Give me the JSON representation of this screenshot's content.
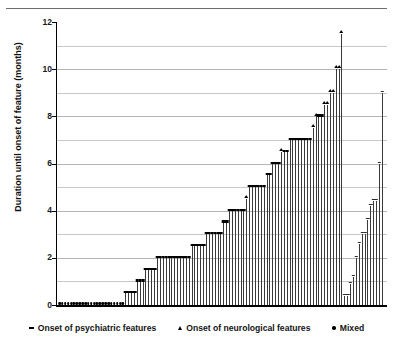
{
  "chart_data": {
    "type": "bar",
    "title": "",
    "xlabel": "",
    "ylabel": "Duration until onset of feature (months)",
    "ylim": [
      0,
      12
    ],
    "ytick_values": [
      0,
      2,
      4,
      6,
      8,
      10,
      12
    ],
    "ytick_labels": [
      "0",
      "2",
      "4",
      "6",
      "8",
      "10",
      "12"
    ],
    "gridlines": [
      1,
      2,
      3,
      4,
      5,
      6,
      7,
      8,
      9,
      10,
      11
    ],
    "grid": true,
    "legend_position": "below-axis",
    "x_axis_visible_ticks": false,
    "marker_categories": [
      {
        "key": "psychiatric",
        "marker": "dash",
        "label": "Onset of psychiatric features"
      },
      {
        "key": "neurological",
        "marker": "triangle",
        "label": "Onset of neurological features"
      },
      {
        "key": "mixed",
        "marker": "dot",
        "label": "Mixed"
      }
    ],
    "values": [
      0,
      0,
      0,
      0,
      0,
      0,
      0,
      0,
      0,
      0,
      0,
      0,
      0,
      0,
      0,
      0,
      0,
      0,
      0,
      0,
      0,
      0,
      0,
      0.5,
      0.5,
      0.5,
      0.5,
      1.0,
      1.0,
      1.0,
      1.5,
      1.5,
      1.5,
      1.5,
      2.0,
      2.0,
      2.0,
      2.0,
      2.0,
      2.0,
      2.0,
      2.0,
      2.0,
      2.0,
      2.0,
      2.0,
      2.5,
      2.5,
      2.5,
      2.5,
      2.5,
      3.0,
      3.0,
      3.0,
      3.0,
      3.0,
      3.0,
      3.5,
      3.5,
      4.0,
      4.0,
      4.0,
      4.0,
      4.0,
      4.0,
      4.5,
      5.0,
      5.0,
      5.0,
      5.0,
      5.0,
      5.0,
      5.5,
      5.5,
      6.0,
      6.0,
      6.0,
      6.5,
      6.5,
      6.5,
      7.0,
      7.0,
      7.0,
      7.0,
      7.0,
      7.0,
      7.0,
      7.0,
      7.5,
      8.0,
      8.0,
      8.0,
      8.5,
      8.5,
      9.0,
      9.0,
      10.0,
      10.0,
      11.5,
      0.4,
      0.4,
      0.9,
      1.2,
      2.0,
      2.6,
      3.0,
      3.0,
      3.6,
      4.2,
      4.4,
      4.4,
      6.0,
      9.0
    ],
    "marker_types": [
      "mixed",
      "mixed",
      "mixed",
      "mixed",
      "mixed",
      "mixed",
      "mixed",
      "mixed",
      "mixed",
      "mixed",
      "mixed",
      "mixed",
      "mixed",
      "mixed",
      "mixed",
      "mixed",
      "mixed",
      "mixed",
      "mixed",
      "mixed",
      "mixed",
      "mixed",
      "mixed",
      "psychiatric",
      "psychiatric",
      "psychiatric",
      "psychiatric",
      "psychiatric",
      "psychiatric",
      "psychiatric",
      "psychiatric",
      "psychiatric",
      "psychiatric",
      "psychiatric",
      "psychiatric",
      "psychiatric",
      "psychiatric",
      "psychiatric",
      "psychiatric",
      "psychiatric",
      "psychiatric",
      "psychiatric",
      "psychiatric",
      "psychiatric",
      "psychiatric",
      "psychiatric",
      "psychiatric",
      "psychiatric",
      "psychiatric",
      "psychiatric",
      "psychiatric",
      "psychiatric",
      "psychiatric",
      "psychiatric",
      "psychiatric",
      "psychiatric",
      "psychiatric",
      "psychiatric",
      "psychiatric",
      "psychiatric",
      "psychiatric",
      "psychiatric",
      "psychiatric",
      "psychiatric",
      "psychiatric",
      "neurological",
      "psychiatric",
      "psychiatric",
      "psychiatric",
      "psychiatric",
      "psychiatric",
      "psychiatric",
      "psychiatric",
      "psychiatric",
      "psychiatric",
      "psychiatric",
      "psychiatric",
      "neurological",
      "psychiatric",
      "psychiatric",
      "psychiatric",
      "psychiatric",
      "psychiatric",
      "psychiatric",
      "psychiatric",
      "psychiatric",
      "psychiatric",
      "psychiatric",
      "neurological",
      "neurological",
      "psychiatric",
      "psychiatric",
      "neurological",
      "neurological",
      "neurological",
      "neurological",
      "neurological",
      "neurological",
      "neurological",
      "thin",
      "thin",
      "thin",
      "thin",
      "thin",
      "thin",
      "thin",
      "thin",
      "thin",
      "thin",
      "thin",
      "thin",
      "thin",
      "thin"
    ]
  },
  "legend": {
    "items": [
      {
        "label": "Onset of psychiatric features"
      },
      {
        "label": "Onset of neurological features"
      },
      {
        "label": "Mixed"
      }
    ]
  },
  "colors": {
    "bar": "#3a3a3a",
    "marker": "#000000",
    "grid": "#c8c8c8",
    "axis": "#000000",
    "background": "#ffffff"
  }
}
